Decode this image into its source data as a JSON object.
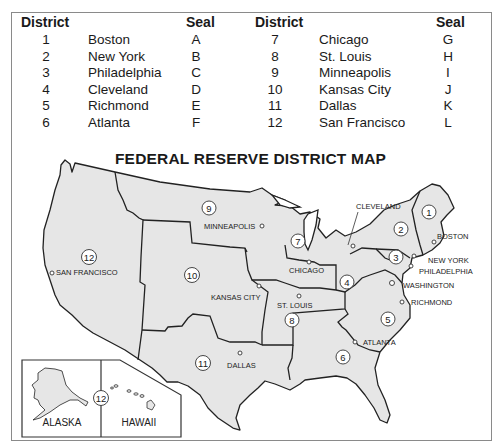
{
  "table": {
    "header_district": "District",
    "header_seal": "Seal",
    "left_rows": [
      {
        "district": "1",
        "city": "Boston",
        "seal": "A"
      },
      {
        "district": "2",
        "city": "New York",
        "seal": "B"
      },
      {
        "district": "3",
        "city": "Philadelphia",
        "seal": "C"
      },
      {
        "district": "4",
        "city": "Cleveland",
        "seal": "D"
      },
      {
        "district": "5",
        "city": "Richmond",
        "seal": "E"
      },
      {
        "district": "6",
        "city": "Atlanta",
        "seal": "F"
      }
    ],
    "right_rows": [
      {
        "district": "7",
        "city": "Chicago",
        "seal": "G"
      },
      {
        "district": "8",
        "city": "St. Louis",
        "seal": "H"
      },
      {
        "district": "9",
        "city": "Minneapolis",
        "seal": "I"
      },
      {
        "district": "10",
        "city": "Kansas City",
        "seal": "J"
      },
      {
        "district": "11",
        "city": "Dallas",
        "seal": "K"
      },
      {
        "district": "12",
        "city": "San Francisco",
        "seal": "L"
      }
    ]
  },
  "map": {
    "title": "FEDERAL RESERVE DISTRICT MAP",
    "fill_color": "#e6e6e6",
    "line_color": "#222222",
    "district_markers": [
      {
        "number": "1",
        "x": 429,
        "y": 212
      },
      {
        "number": "2",
        "x": 401,
        "y": 229
      },
      {
        "number": "3",
        "x": 396,
        "y": 257
      },
      {
        "number": "4",
        "x": 347,
        "y": 282
      },
      {
        "number": "5",
        "x": 388,
        "y": 319
      },
      {
        "number": "6",
        "x": 343,
        "y": 357
      },
      {
        "number": "7",
        "x": 298,
        "y": 241
      },
      {
        "number": "8",
        "x": 292,
        "y": 320
      },
      {
        "number": "9",
        "x": 209,
        "y": 208
      },
      {
        "number": "10",
        "x": 192,
        "y": 275
      },
      {
        "number": "11",
        "x": 203,
        "y": 363
      },
      {
        "number": "12",
        "x": 89,
        "y": 257
      }
    ],
    "cities": [
      {
        "name": "BOSTON",
        "x": 437,
        "y": 236
      },
      {
        "name": "NEW YORK",
        "x": 428,
        "y": 260
      },
      {
        "name": "PHILADELPHIA",
        "x": 419,
        "y": 271
      },
      {
        "name": "CLEVELAND",
        "x": 354,
        "y": 209
      },
      {
        "name": "WASHINGTON",
        "x": 403,
        "y": 285
      },
      {
        "name": "RICHMOND",
        "x": 411,
        "y": 303
      },
      {
        "name": "ATLANTA",
        "x": 363,
        "y": 345
      },
      {
        "name": "CHICAGO",
        "x": 288,
        "y": 273
      },
      {
        "name": "ST. LOUIS",
        "x": 276,
        "y": 309
      },
      {
        "name": "MINNEAPOLIS",
        "x": 204,
        "y": 230
      },
      {
        "name": "KANSAS CITY",
        "x": 211,
        "y": 300
      },
      {
        "name": "DALLAS",
        "x": 227,
        "y": 368
      },
      {
        "name": "SAN FRANCISCO",
        "x": 55,
        "y": 275
      }
    ],
    "inset": {
      "alaska_label": "ALASKA",
      "hawaii_label": "HAWAII",
      "district_number": "12"
    }
  }
}
